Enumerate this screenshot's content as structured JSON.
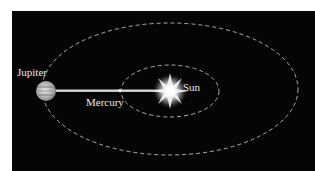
{
  "diagram": {
    "background_color": "#050505",
    "orbit_color": "#bdbdbd",
    "beam_color": "#d8d8d8",
    "bodies": {
      "jupiter": {
        "label": "Jupiter"
      },
      "mercury": {
        "label": "Mercury"
      },
      "sun": {
        "label": "Sun"
      }
    },
    "orbits": [
      {
        "name": "outer-orbit",
        "body": "Jupiter"
      },
      {
        "name": "inner-orbit",
        "body": "Mercury"
      }
    ]
  }
}
